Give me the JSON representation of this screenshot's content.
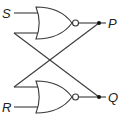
{
  "diagram": {
    "type": "SR latch (cross-coupled NOR gates)",
    "inputs": {
      "top": "S",
      "bottom": "R"
    },
    "outputs": {
      "top": "P",
      "bottom": "Q"
    },
    "gates": [
      {
        "id": "nor-top",
        "kind": "NOR",
        "inputs": [
          "S",
          "Q"
        ],
        "output": "P"
      },
      {
        "id": "nor-bottom",
        "kind": "NOR",
        "inputs": [
          "P",
          "R"
        ],
        "output": "Q"
      }
    ],
    "colors": {
      "line": "#3a3a3a",
      "dot": "#111111",
      "background": "#ffffff"
    }
  }
}
